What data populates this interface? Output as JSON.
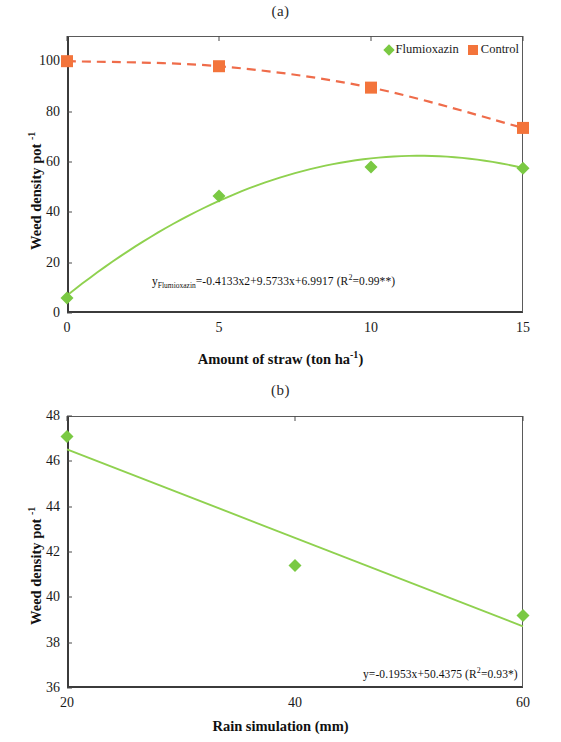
{
  "figure": {
    "panel_a_label": "(a)",
    "panel_b_label": "(b)"
  },
  "chart_data": [
    {
      "id": "a",
      "type": "scatter",
      "title": "(a)",
      "xlabel": "Amount of straw (ton ha-1)",
      "xlabel_base": "Amount of straw (ton ha",
      "xlabel_sup": "-1",
      "xlabel_tail": ")",
      "ylabel": "Weed density pot -1",
      "ylabel_base": "Weed density pot ",
      "ylabel_sup": "-1",
      "xlim": [
        0,
        15
      ],
      "ylim": [
        0,
        110
      ],
      "xticks": [
        "0",
        "5",
        "10",
        "15"
      ],
      "xtick_values": [
        0,
        5,
        10,
        15
      ],
      "yticks": [
        "0",
        "20",
        "40",
        "60",
        "80",
        "100"
      ],
      "ytick_values": [
        0,
        20,
        40,
        60,
        80,
        100
      ],
      "grid": false,
      "legend_position": "top-right",
      "x": [
        0,
        5,
        10,
        15
      ],
      "series": [
        {
          "name": "Flumioxazin",
          "marker": "diamond",
          "color": "#7ac943",
          "line_style": "solid",
          "line_color": "#8fd14f",
          "values": [
            6,
            46.5,
            58,
            57.5
          ],
          "fit": "quadratic",
          "fit_coefficients": [
            -0.4133,
            9.5733,
            6.9917
          ],
          "r_squared": 0.99
        },
        {
          "name": "Control",
          "marker": "square",
          "color": "#f3743b",
          "line_style": "dashed",
          "line_color": "#ef6c4a",
          "values": [
            100,
            98,
            89.5,
            73.5
          ]
        }
      ],
      "annotation": {
        "prefix": "y",
        "subscript": "Flumioxazin",
        "body": "=-0.4133x2+9.5733x+6.9917 (R",
        "sup": "2",
        "tail": "=0.99**)",
        "full_text": "yFlumioxazin=-0.4133x2+9.5733x+6.9917 (R2=0.99**)"
      }
    },
    {
      "id": "b",
      "type": "scatter",
      "title": "(b)",
      "xlabel": "Rain simulation (mm)",
      "ylabel": "Weed density pot -1",
      "ylabel_base": "Weed density pot ",
      "ylabel_sup": "-1",
      "xlim": [
        20,
        60
      ],
      "ylim": [
        36,
        48
      ],
      "xticks": [
        "20",
        "40",
        "60"
      ],
      "xtick_values": [
        20,
        40,
        60
      ],
      "yticks": [
        "36",
        "38",
        "40",
        "42",
        "44",
        "46",
        "48"
      ],
      "ytick_values": [
        36,
        38,
        40,
        42,
        44,
        46,
        48
      ],
      "grid": false,
      "x": [
        20,
        40,
        60
      ],
      "series": [
        {
          "name": "Flumioxazin",
          "marker": "diamond",
          "color": "#7ac943",
          "line_style": "solid",
          "line_color": "#8fd14f",
          "values": [
            47.1,
            41.4,
            39.2
          ],
          "fit": "linear",
          "fit_coefficients": [
            -0.1953,
            50.4375
          ],
          "r_squared": 0.93
        }
      ],
      "annotation": {
        "body": "y=-0.1953x+50.4375 (R",
        "sup": "2",
        "tail": "=0.93*)",
        "full_text": "y=-0.1953x+50.4375 (R2=0.93*)"
      }
    }
  ]
}
